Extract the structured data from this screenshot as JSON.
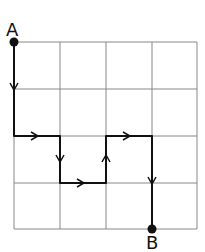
{
  "diagram": {
    "type": "grid-path",
    "grid": {
      "columns": 4,
      "rows": 4
    },
    "start_label": "A",
    "end_label": "B",
    "path": [
      {
        "from": [
          0,
          0
        ],
        "to": [
          0,
          2
        ],
        "direction": "down"
      },
      {
        "from": [
          0,
          2
        ],
        "to": [
          1,
          2
        ],
        "direction": "right"
      },
      {
        "from": [
          1,
          2
        ],
        "to": [
          1,
          3
        ],
        "direction": "down"
      },
      {
        "from": [
          1,
          3
        ],
        "to": [
          2,
          3
        ],
        "direction": "right"
      },
      {
        "from": [
          2,
          3
        ],
        "to": [
          2,
          2
        ],
        "direction": "up"
      },
      {
        "from": [
          2,
          2
        ],
        "to": [
          3,
          2
        ],
        "direction": "right"
      },
      {
        "from": [
          3,
          2
        ],
        "to": [
          3,
          4
        ],
        "direction": "down"
      }
    ],
    "colors": {
      "grid": "#888888",
      "path": "#111111"
    }
  }
}
